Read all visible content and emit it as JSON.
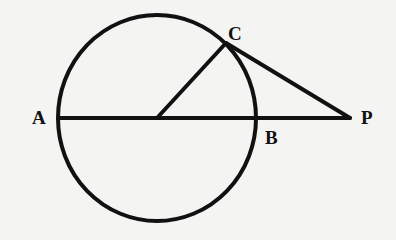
{
  "diagram": {
    "type": "geometry",
    "colors": {
      "stroke": "#111111",
      "background": "#f4f4f2"
    },
    "points": {
      "A": {
        "label": "A",
        "x": 59,
        "y": 118
      },
      "B": {
        "label": "B",
        "x": 259,
        "y": 118
      },
      "C": {
        "label": "C",
        "x": 226,
        "y": 43
      },
      "P": {
        "label": "P",
        "x": 350,
        "y": 118
      },
      "O": {
        "label": "",
        "x": 157,
        "y": 118
      }
    },
    "circle": {
      "cx": 157,
      "cy": 118,
      "rx": 99,
      "ry": 103
    },
    "segments": [
      {
        "from": "A",
        "to": "P"
      },
      {
        "from": "O",
        "to": "C"
      },
      {
        "from": "C",
        "to": "P"
      }
    ],
    "labels": {
      "A": "A",
      "B": "B",
      "C": "C",
      "P": "P"
    }
  }
}
